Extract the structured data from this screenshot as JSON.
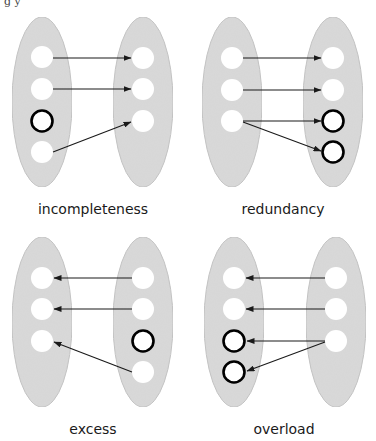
{
  "top_fragment": "g              y",
  "colors": {
    "ellipse_fill": "#d9d9d9",
    "ellipse_stroke": "#c4c4c4",
    "node_fill": "#ffffff",
    "highlight_stroke": "#000000",
    "arrow": "#1a1a1a",
    "text": "#1a1a1a"
  },
  "panels": [
    {
      "id": "incompleteness",
      "label": "incompleteness",
      "label_pos": [
        93,
        214
      ],
      "ellipses": [
        {
          "cx": 42,
          "cy": 102,
          "rx": 30,
          "ry": 85
        },
        {
          "cx": 143,
          "cy": 102,
          "rx": 30,
          "ry": 85
        }
      ],
      "left_nodes": [
        {
          "cx": 42,
          "cy": 57,
          "bold": false
        },
        {
          "cx": 42,
          "cy": 89,
          "bold": false
        },
        {
          "cx": 42,
          "cy": 121,
          "bold": true
        },
        {
          "cx": 42,
          "cy": 152,
          "bold": false
        }
      ],
      "right_nodes": [
        {
          "cx": 143,
          "cy": 58,
          "bold": false
        },
        {
          "cx": 143,
          "cy": 89,
          "bold": false
        },
        {
          "cx": 143,
          "cy": 121,
          "bold": false
        }
      ],
      "arrows": [
        {
          "x1": 53,
          "y1": 58,
          "x2": 131,
          "y2": 58
        },
        {
          "x1": 53,
          "y1": 89,
          "x2": 131,
          "y2": 89
        },
        {
          "x1": 53,
          "y1": 152,
          "x2": 131,
          "y2": 122
        }
      ]
    },
    {
      "id": "redundancy",
      "label": "redundancy",
      "label_pos": [
        283,
        214
      ],
      "ellipses": [
        {
          "cx": 232,
          "cy": 102,
          "rx": 30,
          "ry": 85
        },
        {
          "cx": 333,
          "cy": 102,
          "rx": 30,
          "ry": 85
        }
      ],
      "left_nodes": [
        {
          "cx": 232,
          "cy": 58,
          "bold": false
        },
        {
          "cx": 232,
          "cy": 90,
          "bold": false
        },
        {
          "cx": 232,
          "cy": 121,
          "bold": false
        }
      ],
      "right_nodes": [
        {
          "cx": 333,
          "cy": 58,
          "bold": false
        },
        {
          "cx": 333,
          "cy": 90,
          "bold": false
        },
        {
          "cx": 333,
          "cy": 121,
          "bold": true
        },
        {
          "cx": 333,
          "cy": 152,
          "bold": true
        }
      ],
      "arrows": [
        {
          "x1": 243,
          "y1": 58,
          "x2": 321,
          "y2": 58
        },
        {
          "x1": 243,
          "y1": 90,
          "x2": 321,
          "y2": 90
        },
        {
          "x1": 243,
          "y1": 121,
          "x2": 321,
          "y2": 121
        },
        {
          "x1": 243,
          "y1": 122,
          "x2": 321,
          "y2": 151
        }
      ]
    },
    {
      "id": "excess",
      "label": "excess",
      "label_pos": [
        93,
        434
      ],
      "ellipses": [
        {
          "cx": 42,
          "cy": 322,
          "rx": 30,
          "ry": 85
        },
        {
          "cx": 143,
          "cy": 322,
          "rx": 30,
          "ry": 85
        }
      ],
      "left_nodes": [
        {
          "cx": 42,
          "cy": 278,
          "bold": false
        },
        {
          "cx": 42,
          "cy": 309,
          "bold": false
        },
        {
          "cx": 42,
          "cy": 341,
          "bold": false
        }
      ],
      "right_nodes": [
        {
          "cx": 143,
          "cy": 278,
          "bold": false
        },
        {
          "cx": 143,
          "cy": 309,
          "bold": false
        },
        {
          "cx": 143,
          "cy": 341,
          "bold": true
        },
        {
          "cx": 143,
          "cy": 372,
          "bold": false
        }
      ],
      "arrows": [
        {
          "x1": 132,
          "y1": 278,
          "x2": 54,
          "y2": 278
        },
        {
          "x1": 132,
          "y1": 309,
          "x2": 54,
          "y2": 309
        },
        {
          "x1": 132,
          "y1": 372,
          "x2": 54,
          "y2": 342
        }
      ]
    },
    {
      "id": "overload",
      "label": "overload",
      "label_pos": [
        284,
        434
      ],
      "ellipses": [
        {
          "cx": 234,
          "cy": 322,
          "rx": 30,
          "ry": 85
        },
        {
          "cx": 336,
          "cy": 322,
          "rx": 30,
          "ry": 85
        }
      ],
      "left_nodes": [
        {
          "cx": 234,
          "cy": 278,
          "bold": false
        },
        {
          "cx": 234,
          "cy": 309,
          "bold": false
        },
        {
          "cx": 234,
          "cy": 341,
          "bold": true
        },
        {
          "cx": 234,
          "cy": 372,
          "bold": true
        }
      ],
      "right_nodes": [
        {
          "cx": 336,
          "cy": 278,
          "bold": false
        },
        {
          "cx": 336,
          "cy": 309,
          "bold": false
        },
        {
          "cx": 336,
          "cy": 341,
          "bold": false
        }
      ],
      "arrows": [
        {
          "x1": 325,
          "y1": 278,
          "x2": 246,
          "y2": 278
        },
        {
          "x1": 325,
          "y1": 309,
          "x2": 246,
          "y2": 309
        },
        {
          "x1": 325,
          "y1": 341,
          "x2": 247,
          "y2": 341
        },
        {
          "x1": 325,
          "y1": 342,
          "x2": 247,
          "y2": 371
        }
      ]
    }
  ]
}
